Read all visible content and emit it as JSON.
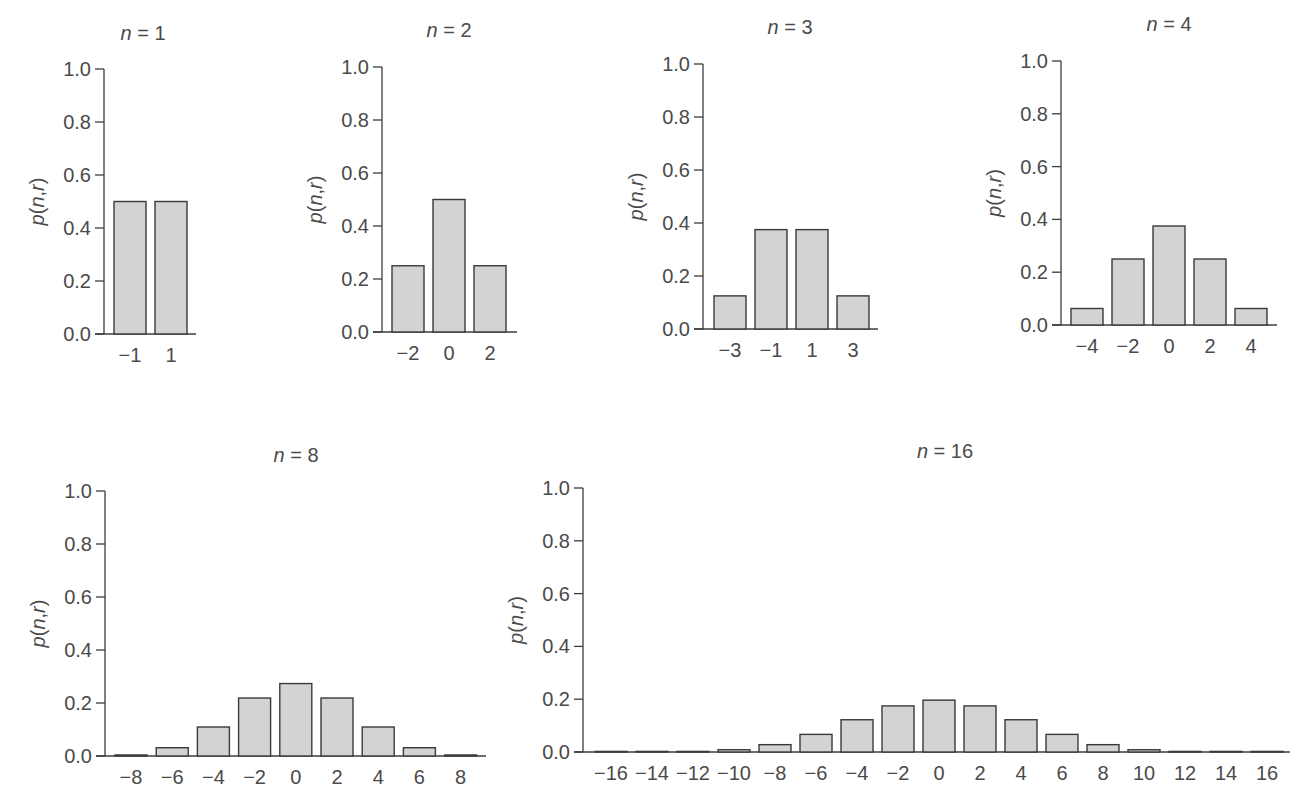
{
  "figure": {
    "colors": {
      "bar_fill": "#d3d3d3",
      "bar_stroke": "#3a3a3a",
      "axis": "#3c3c3c",
      "text": "#4a4a4a"
    }
  },
  "chart_data": [
    {
      "type": "bar",
      "title": "n = 1",
      "xlabel": "",
      "ylabel": "p(n,r)",
      "ylim": [
        0,
        1
      ],
      "yticks": [
        "0.0",
        "0.2",
        "0.4",
        "0.6",
        "0.8",
        "1.0"
      ],
      "categories": [
        "−1",
        "1"
      ],
      "values": [
        0.5,
        0.5
      ],
      "layout": {
        "axis_x": 104,
        "y0": 334,
        "y1": 69,
        "first_center": 130,
        "step": 41,
        "bar_width": 32,
        "axis_end": 196,
        "title_x": 143,
        "title_y": 40
      }
    },
    {
      "type": "bar",
      "title": "n = 2",
      "xlabel": "",
      "ylabel": "p(n,r)",
      "ylim": [
        0,
        1
      ],
      "yticks": [
        "0.0",
        "0.2",
        "0.4",
        "0.6",
        "0.8",
        "1.0"
      ],
      "categories": [
        "−2",
        "0",
        "2"
      ],
      "values": [
        0.25,
        0.5,
        0.25
      ],
      "layout": {
        "axis_x": 382,
        "y0": 332,
        "y1": 67,
        "first_center": 408,
        "step": 41,
        "bar_width": 32,
        "axis_end": 517,
        "title_x": 449,
        "title_y": 37
      }
    },
    {
      "type": "bar",
      "title": "n = 3",
      "xlabel": "",
      "ylabel": "p(n,r)",
      "ylim": [
        0,
        1
      ],
      "yticks": [
        "0.0",
        "0.2",
        "0.4",
        "0.6",
        "0.8",
        "1.0"
      ],
      "categories": [
        "−3",
        "−1",
        "1",
        "3"
      ],
      "values": [
        0.125,
        0.375,
        0.375,
        0.125
      ],
      "layout": {
        "axis_x": 703,
        "y0": 329,
        "y1": 64,
        "first_center": 730,
        "step": 41,
        "bar_width": 32,
        "axis_end": 878,
        "title_x": 790,
        "title_y": 34
      }
    },
    {
      "type": "bar",
      "title": "n = 4",
      "xlabel": "",
      "ylabel": "p(n,r)",
      "ylim": [
        0,
        1
      ],
      "yticks": [
        "0.0",
        "0.2",
        "0.4",
        "0.6",
        "0.8",
        "1.0"
      ],
      "categories": [
        "−4",
        "−2",
        "0",
        "2",
        "4"
      ],
      "values": [
        0.0625,
        0.25,
        0.375,
        0.25,
        0.0625
      ],
      "layout": {
        "axis_x": 1061,
        "y0": 325,
        "y1": 61,
        "first_center": 1087,
        "step": 41,
        "bar_width": 32,
        "axis_end": 1277,
        "title_x": 1169,
        "title_y": 31
      }
    },
    {
      "type": "bar",
      "title": "n = 8",
      "xlabel": "",
      "ylabel": "p(n,r)",
      "ylim": [
        0,
        1
      ],
      "yticks": [
        "0.0",
        "0.2",
        "0.4",
        "0.6",
        "0.8",
        "1.0"
      ],
      "categories": [
        "−8",
        "−6",
        "−4",
        "−2",
        "0",
        "2",
        "4",
        "6",
        "8"
      ],
      "values": [
        0.0039,
        0.0313,
        0.1094,
        0.2188,
        0.2734,
        0.2188,
        0.1094,
        0.0313,
        0.0039
      ],
      "layout": {
        "axis_x": 105,
        "y0": 756,
        "y1": 491,
        "first_center": 131,
        "step": 41.2,
        "bar_width": 32,
        "axis_end": 486,
        "title_x": 296,
        "title_y": 462
      }
    },
    {
      "type": "bar",
      "title": "n = 16",
      "xlabel": "",
      "ylabel": "p(n,r)",
      "ylim": [
        0,
        1
      ],
      "yticks": [
        "0.0",
        "0.2",
        "0.4",
        "0.6",
        "0.8",
        "1.0"
      ],
      "categories": [
        "−16",
        "−14",
        "−12",
        "−10",
        "−8",
        "−6",
        "−4",
        "−2",
        "0",
        "2",
        "4",
        "6",
        "8",
        "10",
        "12",
        "14",
        "16"
      ],
      "values": [
        1.53e-05,
        0.000244,
        0.00183,
        0.00854,
        0.0278,
        0.0667,
        0.1222,
        0.1746,
        0.1964,
        0.1746,
        0.1222,
        0.0667,
        0.0278,
        0.00854,
        0.00183,
        0.000244,
        1.53e-05
      ],
      "layout": {
        "axis_x": 583,
        "y0": 752,
        "y1": 488,
        "first_center": 611,
        "step": 41,
        "bar_width": 32,
        "axis_end": 1290,
        "title_x": 945,
        "title_y": 458
      }
    }
  ]
}
